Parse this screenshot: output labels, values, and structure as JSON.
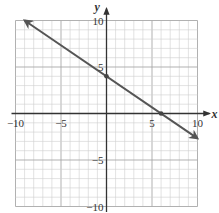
{
  "chart_data": {
    "type": "line",
    "title": "",
    "xlabel": "x",
    "ylabel": "y",
    "xlim": [
      -10,
      10
    ],
    "ylim": [
      -10,
      10
    ],
    "grid": true,
    "grid_step": 1,
    "x_ticks": [
      -10,
      -5,
      5,
      10
    ],
    "y_ticks": [
      10,
      5,
      -5,
      -10
    ],
    "x_tick_labels": [
      "−10",
      "−5",
      "5",
      "10"
    ],
    "y_tick_labels": [
      "10",
      "5",
      "−5",
      "−10"
    ],
    "series": [
      {
        "name": "line",
        "equation": "y = -2/3 x + 4",
        "x": [
          -9,
          10
        ],
        "y": [
          10,
          -2.67
        ],
        "arrows": "both",
        "color": "#555555"
      }
    ],
    "points": [
      {
        "x": 0,
        "y": 4,
        "label": "y-intercept"
      },
      {
        "x": 6,
        "y": 0,
        "label": "x-intercept"
      }
    ]
  },
  "colors": {
    "grid": "#cfcfcf",
    "grid_major": "#a8a8a8",
    "axis": "#333333",
    "line": "#555555"
  }
}
